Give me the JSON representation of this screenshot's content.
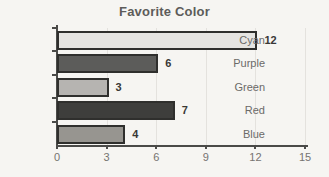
{
  "chart_data": {
    "type": "bar",
    "orientation": "horizontal",
    "title": "Favorite Color",
    "categories": [
      "Cyan",
      "Purple",
      "Green",
      "Red",
      "Blue"
    ],
    "values": [
      12,
      6,
      3,
      7,
      4
    ],
    "xlabel": "",
    "ylabel": "",
    "xlim": [
      0,
      15
    ],
    "x_ticks": [
      0,
      3,
      6,
      9,
      12,
      15
    ],
    "grid": true,
    "legend": "none",
    "bar_fill_colors": [
      "#e5e4e1",
      "#5c5c5a",
      "#b6b4b1",
      "#3e3e3c",
      "#979590"
    ],
    "bar_border_color": "#2f2f2d",
    "gridline_color": "#e4e2de",
    "axis_color": "#4a4a48",
    "title_color": "#5d5c5a",
    "category_label_color": "#6b6a68",
    "tick_label_color": "#757370",
    "value_label_color": "#393836",
    "background_color": "#f6f5f2"
  }
}
